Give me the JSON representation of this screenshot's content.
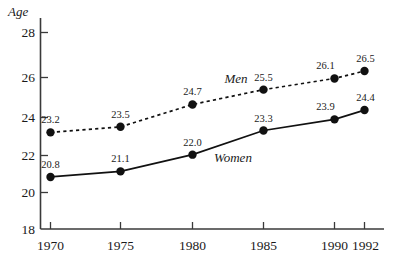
{
  "chart_data": {
    "type": "line",
    "title": "",
    "xlabel": "",
    "ylabel": "Age",
    "x": [
      1970,
      1975,
      1980,
      1985,
      1990,
      1992
    ],
    "xtick_labels": [
      "1970",
      "1975",
      "1980",
      "1985",
      "1990",
      "1992"
    ],
    "ytick_labels": [
      "18",
      "20",
      "22",
      "24",
      "26",
      "28"
    ],
    "yticks": [
      18,
      20,
      22,
      24,
      26,
      28
    ],
    "ylim": [
      18,
      28.6
    ],
    "xlim": [
      1968.2,
      1993.4
    ],
    "grid": false,
    "legend_position": "inline-annotation",
    "series": [
      {
        "name": "Men",
        "style": "dashed",
        "marker": "filled-circle",
        "values": [
          23.2,
          23.5,
          24.7,
          25.5,
          26.1,
          26.5
        ],
        "value_labels": [
          "23.2",
          "23.5",
          "24.7",
          "25.5",
          "26.1",
          "26.5"
        ]
      },
      {
        "name": "Women",
        "style": "solid",
        "marker": "filled-circle",
        "values": [
          20.8,
          21.1,
          22.0,
          23.3,
          23.9,
          24.4
        ],
        "value_labels": [
          "20.8",
          "21.1",
          "22.0",
          "23.3",
          "23.9",
          "24.4"
        ]
      }
    ],
    "annotations": [
      {
        "text": "Men",
        "x": 1983.2,
        "y": 25.35
      },
      {
        "text": "Women",
        "x": 1982.6,
        "y": 21.3
      }
    ],
    "colors": {
      "line": "#111111",
      "axis": "#3a3a3a",
      "text": "#1a1a1a",
      "background": "#ffffff"
    }
  }
}
